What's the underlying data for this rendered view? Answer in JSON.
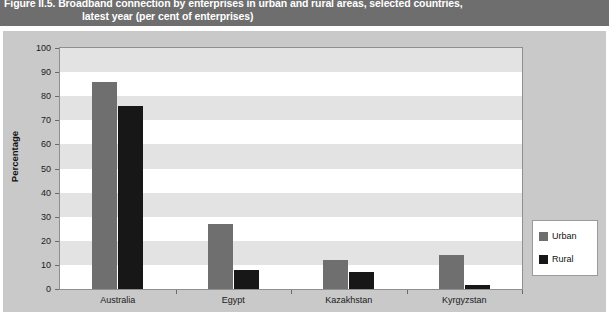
{
  "figure": {
    "title_line_1": "Figure II.5. Broadband connection by enterprises in urban and rural areas, selected countries,",
    "title_line_2": "latest year (per cent of enterprises)"
  },
  "chart_data": {
    "type": "bar",
    "title": "Figure II.5. Broadband connection by enterprises in urban and rural areas, selected countries, latest year (per cent of enterprises)",
    "xlabel": "",
    "ylabel": "Percentage",
    "ylim": [
      0,
      100
    ],
    "ytick_step": 10,
    "yticks": [
      "100",
      "90",
      "80",
      "70",
      "60",
      "50",
      "40",
      "30",
      "20",
      "10",
      "0"
    ],
    "grid": "horizontal-bands",
    "legend_position": "right",
    "categories": [
      "Australia",
      "Egypt",
      "Kazakhstan",
      "Kyrgyzstan"
    ],
    "series": [
      {
        "name": "Urban",
        "color": "#6f6f6f",
        "values": [
          86,
          27,
          12,
          14
        ]
      },
      {
        "name": "Rural",
        "color": "#171717",
        "values": [
          76,
          8,
          7,
          1.5
        ]
      }
    ]
  },
  "legend": {
    "items": [
      {
        "label": "Urban",
        "color": "#6f6f6f"
      },
      {
        "label": "Rural",
        "color": "#171717"
      }
    ]
  },
  "colors": {
    "banner_bg": "#6e6e6e",
    "panel_bg": "#c9c9c9",
    "plot_bg": "#ffffff",
    "band": "#e3e3e3",
    "urban": "#6f6f6f",
    "rural": "#171717"
  }
}
